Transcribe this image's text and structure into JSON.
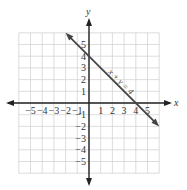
{
  "chart_data": {
    "type": "line",
    "title": "",
    "xlabel": "x",
    "ylabel": "y",
    "xlim": [
      -6,
      6
    ],
    "ylim": [
      -6,
      6
    ],
    "grid": true,
    "x_ticks": [
      -5,
      -4,
      -3,
      -2,
      -1,
      1,
      2,
      3,
      4,
      5
    ],
    "y_ticks": [
      -5,
      -4,
      -3,
      -2,
      -1,
      1,
      2,
      3,
      4,
      5
    ],
    "x_tick_labels": [
      "−5",
      "−4",
      "−3",
      "−2",
      "−1",
      "1",
      "2",
      "3",
      "4",
      "5"
    ],
    "y_tick_labels": [
      "−5",
      "−4",
      "−3",
      "−2",
      "−1",
      "1",
      "2",
      "3",
      "4",
      "5"
    ],
    "series": [
      {
        "name": "x + y = 4",
        "equation": "x + y = 4",
        "x": [
          -2,
          6
        ],
        "y": [
          6,
          -2
        ],
        "intercepts": {
          "x": 4,
          "y": 4
        },
        "color": "#444444"
      }
    ],
    "annotations": [
      {
        "text": "x + y = 4",
        "position": "along line, near (2, 2)"
      }
    ]
  },
  "labels": {
    "x_axis": "x",
    "y_axis": "y",
    "equation": "x + y = 4"
  },
  "colors": {
    "grid": "#d4d4d4",
    "axis": "#222222",
    "line": "#444444"
  }
}
